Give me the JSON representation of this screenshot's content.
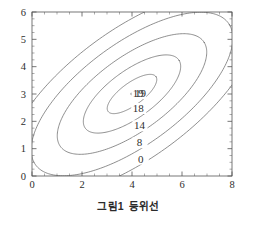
{
  "caption": {
    "label": "그림1",
    "text": "등위선"
  },
  "chart_data": {
    "type": "line",
    "subtype": "contour",
    "title": "",
    "xlabel": "",
    "ylabel": "",
    "xlim": [
      0,
      8
    ],
    "ylim": [
      0,
      6
    ],
    "xticks": [
      0,
      2,
      4,
      6,
      8
    ],
    "xtick_labels": [
      "0",
      "2",
      "4",
      "6",
      "8"
    ],
    "yticks": [
      0,
      1,
      2,
      3,
      4,
      5,
      6
    ],
    "ytick_labels": [
      "0",
      "1",
      "2",
      "3",
      "4",
      "5",
      "6"
    ],
    "x_minor_tick_step": 0.5,
    "y_minor_tick_step": 0.25,
    "grid": false,
    "legend": "none",
    "frame": "box",
    "ticks_all_sides": true,
    "line_color": "#6a6a6a",
    "frame_color": "#555555",
    "text_color": "#2e2e2e",
    "background": "#ffffff",
    "peak": {
      "x": 4,
      "y": 3,
      "value": 19,
      "marker": "dot",
      "label": "19"
    },
    "contour_levels": [
      19,
      18,
      14,
      8,
      0
    ],
    "contours": [
      {
        "level": 19,
        "label": "19",
        "label_x": 4.25,
        "label_y": 3.0,
        "closed": false,
        "note": "peak point marker only"
      },
      {
        "level": 18,
        "label": "18",
        "label_x": 4.25,
        "label_y": 2.45,
        "closed": true,
        "center_x": 4.0,
        "center_y": 3.0,
        "semi_major": 1.15,
        "semi_minor": 0.42,
        "rotation_deg": 33
      },
      {
        "level": 14,
        "label": "14",
        "label_x": 4.3,
        "label_y": 1.82,
        "closed": true,
        "center_x": 4.0,
        "center_y": 3.0,
        "semi_major": 2.25,
        "semi_minor": 0.88,
        "rotation_deg": 33
      },
      {
        "level": 8,
        "label": "8",
        "label_x": 4.3,
        "label_y": 1.2,
        "closed": true,
        "center_x": 4.0,
        "center_y": 3.0,
        "semi_major": 3.45,
        "semi_minor": 1.38,
        "rotation_deg": 33
      },
      {
        "level": 0,
        "label": "0",
        "label_x": 4.35,
        "label_y": 0.6,
        "closed": false,
        "center_x": 4.0,
        "center_y": 3.0,
        "semi_major": 4.65,
        "semi_minor": 1.9,
        "rotation_deg": 33,
        "note": "clipped by plot frame; enters bottom axis near x=2 and exits right edge"
      },
      {
        "level": -6,
        "label": "",
        "label_x": null,
        "label_y": null,
        "closed": false,
        "center_x": 4.0,
        "center_y": 3.0,
        "semi_major": 5.8,
        "semi_minor": 2.4,
        "rotation_deg": 33,
        "note": "outermost arc, unlabeled; clipped by frame"
      }
    ]
  }
}
